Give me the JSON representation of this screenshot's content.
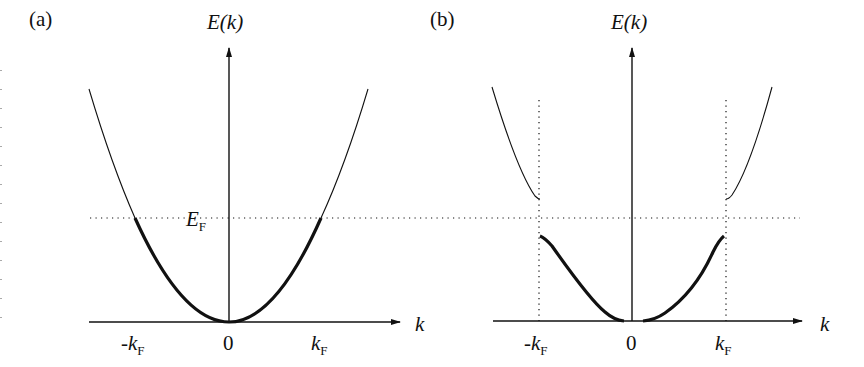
{
  "figure": {
    "panels": [
      {
        "id": "a",
        "label": "(a)",
        "y_axis_label": "E(k)",
        "x_axis_label": "k",
        "fermi_level_label": "E",
        "fermi_level_sub": "F",
        "ticks": [
          {
            "prefix": "-",
            "main": "k",
            "sub": "F"
          },
          {
            "prefix": "",
            "main": "0",
            "sub": ""
          },
          {
            "prefix": "",
            "main": "k",
            "sub": "F"
          }
        ],
        "description": "Free-electron parabolic dispersion; occupied states below E_F drawn thick"
      },
      {
        "id": "b",
        "label": "(b)",
        "y_axis_label": "E(k)",
        "x_axis_label": "k",
        "ticks": [
          {
            "prefix": "-",
            "main": "k",
            "sub": "F"
          },
          {
            "prefix": "",
            "main": "0",
            "sub": ""
          },
          {
            "prefix": "",
            "main": "k",
            "sub": "F"
          }
        ],
        "description": "Dispersion with energy gap opened at ±k_F (Peierls gap); lower band filled (thick), upper band empty (thin)"
      }
    ],
    "colors": {
      "line": "#111111",
      "background": "#ffffff"
    }
  }
}
